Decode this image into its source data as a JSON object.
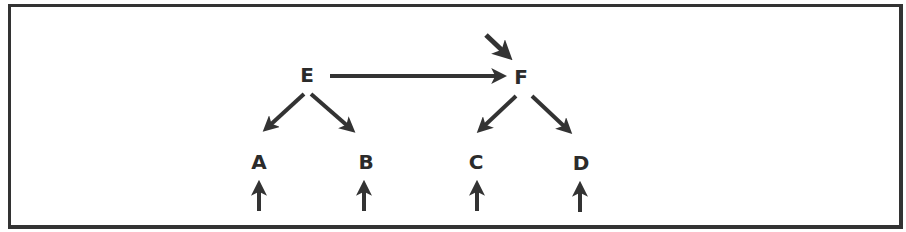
{
  "diagram": {
    "type": "tree",
    "line_color": "#333333",
    "text_color": "#2b2b2b",
    "nodes": [
      {
        "id": "E",
        "label": "E",
        "x": 307,
        "y": 75
      },
      {
        "id": "F",
        "label": "F",
        "x": 521,
        "y": 77
      },
      {
        "id": "A",
        "label": "A",
        "x": 259,
        "y": 162
      },
      {
        "id": "B",
        "label": "B",
        "x": 367,
        "y": 162
      },
      {
        "id": "C",
        "label": "C",
        "x": 476,
        "y": 162
      },
      {
        "id": "D",
        "label": "D",
        "x": 580,
        "y": 162
      }
    ],
    "edges": [
      {
        "from": "E",
        "to": "F",
        "note": "horizontal arrow"
      },
      {
        "from": "E",
        "to": "A"
      },
      {
        "from": "E",
        "to": "B"
      },
      {
        "from": "F",
        "to": "C"
      },
      {
        "from": "F",
        "to": "D"
      },
      {
        "from": "external",
        "to": "F",
        "note": "incoming diagonal arrow from upper-left"
      },
      {
        "from": "external",
        "to": "A",
        "note": "incoming arrow from below"
      },
      {
        "from": "external",
        "to": "B",
        "note": "incoming arrow from below"
      },
      {
        "from": "external",
        "to": "C",
        "note": "incoming arrow from below"
      },
      {
        "from": "external",
        "to": "D",
        "note": "incoming arrow from below"
      }
    ]
  }
}
